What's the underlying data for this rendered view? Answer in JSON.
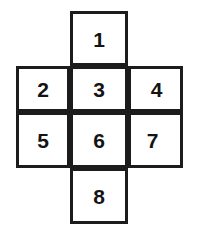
{
  "diagram": {
    "shape": "cross",
    "line_color": "#1c1c1c",
    "fill_color": "#ffffff",
    "text_color": "#141414",
    "cells": [
      {
        "id": "cell-1",
        "label": "1",
        "row": 0,
        "col": 1
      },
      {
        "id": "cell-2",
        "label": "2",
        "row": 1,
        "col": 0
      },
      {
        "id": "cell-3",
        "label": "3",
        "row": 1,
        "col": 1
      },
      {
        "id": "cell-4",
        "label": "4",
        "row": 1,
        "col": 2
      },
      {
        "id": "cell-5",
        "label": "5",
        "row": 2,
        "col": 0
      },
      {
        "id": "cell-6",
        "label": "6",
        "row": 2,
        "col": 1
      },
      {
        "id": "cell-7",
        "label": "7",
        "row": 2,
        "col": 2
      },
      {
        "id": "cell-8",
        "label": "8",
        "row": 3,
        "col": 1
      }
    ]
  }
}
